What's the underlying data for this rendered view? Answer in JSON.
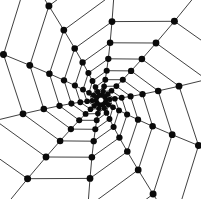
{
  "diagram": {
    "type": "spiral-lattice-network",
    "center": [
      101,
      100
    ],
    "arms": 10,
    "rings": 10,
    "inner_radius": 5,
    "growth": 1.33,
    "twist_per_ring_deg": 17,
    "start_angle_deg": -75,
    "node_radius_outer": 3.6,
    "node_radius_inner": 2.6,
    "colors": {
      "edge": "#2a2a2a",
      "node": "#0a0a0a",
      "background": "#ffffff"
    }
  }
}
